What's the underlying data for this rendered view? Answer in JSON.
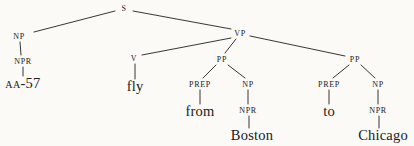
{
  "figure": {
    "kind": "syntax-parse-tree",
    "sentence": "AA-57 fly from Boston to Chicago",
    "background_color": "#fbfaf7",
    "ink_color": "#20201e"
  },
  "nodes": [
    {
      "id": "s",
      "label": "S",
      "kind": "cat",
      "x": 124,
      "y": 8
    },
    {
      "id": "np1",
      "label": "NP",
      "kind": "cat",
      "x": 19,
      "y": 36
    },
    {
      "id": "npr1",
      "label": "NPR",
      "kind": "cat",
      "x": 23,
      "y": 61
    },
    {
      "id": "aa57",
      "label": "AA-57",
      "kind": "scword",
      "x": 23,
      "y": 83
    },
    {
      "id": "vp",
      "label": "VP",
      "kind": "cat",
      "x": 240,
      "y": 33
    },
    {
      "id": "v",
      "label": "V",
      "kind": "cat",
      "x": 134,
      "y": 58
    },
    {
      "id": "fly",
      "label": "fly",
      "kind": "word",
      "x": 135,
      "y": 86
    },
    {
      "id": "pp1",
      "label": "PP",
      "kind": "cat",
      "x": 222,
      "y": 59
    },
    {
      "id": "prep1",
      "label": "PREP",
      "kind": "cat",
      "x": 200,
      "y": 84
    },
    {
      "id": "from",
      "label": "from",
      "kind": "word",
      "x": 200,
      "y": 111
    },
    {
      "id": "np2",
      "label": "NP",
      "kind": "cat",
      "x": 248,
      "y": 84
    },
    {
      "id": "npr2",
      "label": "NPR",
      "kind": "cat",
      "x": 248,
      "y": 110
    },
    {
      "id": "boston",
      "label": "Boston",
      "kind": "word",
      "x": 252,
      "y": 135
    },
    {
      "id": "pp2",
      "label": "PP",
      "kind": "cat",
      "x": 355,
      "y": 59
    },
    {
      "id": "prep2",
      "label": "PREP",
      "kind": "cat",
      "x": 329,
      "y": 84
    },
    {
      "id": "to",
      "label": "to",
      "kind": "word",
      "x": 329,
      "y": 111
    },
    {
      "id": "np3",
      "label": "NP",
      "kind": "cat",
      "x": 378,
      "y": 84
    },
    {
      "id": "npr3",
      "label": "NPR",
      "kind": "cat",
      "x": 378,
      "y": 110
    },
    {
      "id": "chicago",
      "label": "Chicago",
      "kind": "word",
      "x": 383,
      "y": 135
    }
  ],
  "edges": [
    {
      "from": "s",
      "to": "np1",
      "x1": 115,
      "y1": 11,
      "x2": 34,
      "y2": 32
    },
    {
      "from": "s",
      "to": "vp",
      "x1": 133,
      "y1": 11,
      "x2": 231,
      "y2": 29
    },
    {
      "from": "np1",
      "to": "npr1",
      "x1": 20,
      "y1": 42,
      "x2": 21,
      "y2": 55
    },
    {
      "from": "npr1",
      "to": "aa57",
      "x1": 23,
      "y1": 67,
      "x2": 23,
      "y2": 76
    },
    {
      "from": "vp",
      "to": "v",
      "x1": 231,
      "y1": 38,
      "x2": 142,
      "y2": 55
    },
    {
      "from": "vp",
      "to": "pp1",
      "x1": 236,
      "y1": 39,
      "x2": 225,
      "y2": 53
    },
    {
      "from": "vp",
      "to": "pp2",
      "x1": 250,
      "y1": 36,
      "x2": 345,
      "y2": 56
    },
    {
      "from": "v",
      "to": "fly",
      "x1": 135,
      "y1": 64,
      "x2": 135,
      "y2": 79
    },
    {
      "from": "pp1",
      "to": "prep1",
      "x1": 216,
      "y1": 65,
      "x2": 203,
      "y2": 78
    },
    {
      "from": "pp1",
      "to": "np2",
      "x1": 228,
      "y1": 65,
      "x2": 245,
      "y2": 78
    },
    {
      "from": "prep1",
      "to": "from",
      "x1": 200,
      "y1": 90,
      "x2": 200,
      "y2": 104
    },
    {
      "from": "np2",
      "to": "npr2",
      "x1": 248,
      "y1": 90,
      "x2": 248,
      "y2": 104
    },
    {
      "from": "npr2",
      "to": "boston",
      "x1": 249,
      "y1": 116,
      "x2": 249,
      "y2": 128
    },
    {
      "from": "pp2",
      "to": "prep2",
      "x1": 349,
      "y1": 65,
      "x2": 333,
      "y2": 78
    },
    {
      "from": "pp2",
      "to": "np3",
      "x1": 361,
      "y1": 65,
      "x2": 375,
      "y2": 78
    },
    {
      "from": "prep2",
      "to": "to",
      "x1": 329,
      "y1": 90,
      "x2": 329,
      "y2": 104
    },
    {
      "from": "np3",
      "to": "npr3",
      "x1": 378,
      "y1": 90,
      "x2": 378,
      "y2": 104
    },
    {
      "from": "npr3",
      "to": "chicago",
      "x1": 379,
      "y1": 116,
      "x2": 379,
      "y2": 128
    }
  ]
}
